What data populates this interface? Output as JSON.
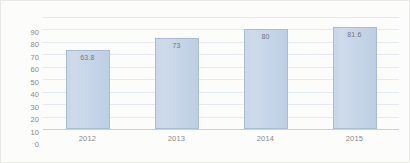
{
  "chart_data": {
    "type": "bar",
    "title": "",
    "subtitle": "",
    "xlabel": "",
    "ylabel": "",
    "categories": [
      "2012",
      "2013",
      "2014",
      "2015"
    ],
    "values": [
      63.8,
      73,
      80,
      81.6
    ],
    "data_labels": [
      "63.8",
      "73",
      "80",
      "81.6"
    ],
    "ylim": [
      0,
      90
    ],
    "ytick_step": 10,
    "yticks": [
      "90",
      "80",
      "70",
      "60",
      "50",
      "40",
      "30",
      "20",
      "10",
      "0"
    ],
    "grid": true,
    "legend": false,
    "legend_position": "none",
    "series": [
      {
        "name": "",
        "values": [
          63.8,
          73,
          80,
          81.6
        ]
      }
    ]
  },
  "style": {
    "bar_fill": "#c6d6e8",
    "bar_border": "#a8bcd6",
    "gridline_color": "#e4eaf0",
    "axis_color": "#c3d2e2",
    "tick_label_color": "#8b8b87",
    "data_label_color": "#76767a",
    "background": "#fcfcfb"
  }
}
